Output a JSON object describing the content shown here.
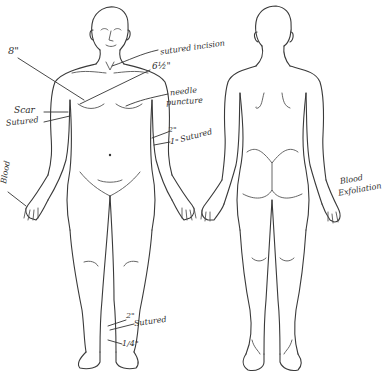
{
  "diagram": {
    "type": "anatomical-body-chart",
    "views": [
      {
        "id": "front",
        "label": "Anterior view"
      },
      {
        "id": "back",
        "label": "Posterior view"
      }
    ],
    "ink_color": "#2e2e2e",
    "background": "#ffffff"
  },
  "annotations": {
    "neck_sutured_incision": "sutured incision",
    "chest_8in": "8\"",
    "chest_6_5in": "6½\"",
    "needle_puncture_line1": "needle",
    "needle_puncture_line2": "puncture",
    "scar_label": "Scar",
    "sutured_label": "Sutured",
    "arm_2in": "2\"",
    "arm_1in": "1\"",
    "arm_sutured": "Sutured",
    "left_hand_blood": "Blood",
    "back_hand_blood_line1": "Blood",
    "back_hand_blood_line2": "Exfoliation",
    "ankle_2in": "2\"",
    "ankle_sutured": "Sutured",
    "ankle_quarter_in": "1/4\""
  }
}
